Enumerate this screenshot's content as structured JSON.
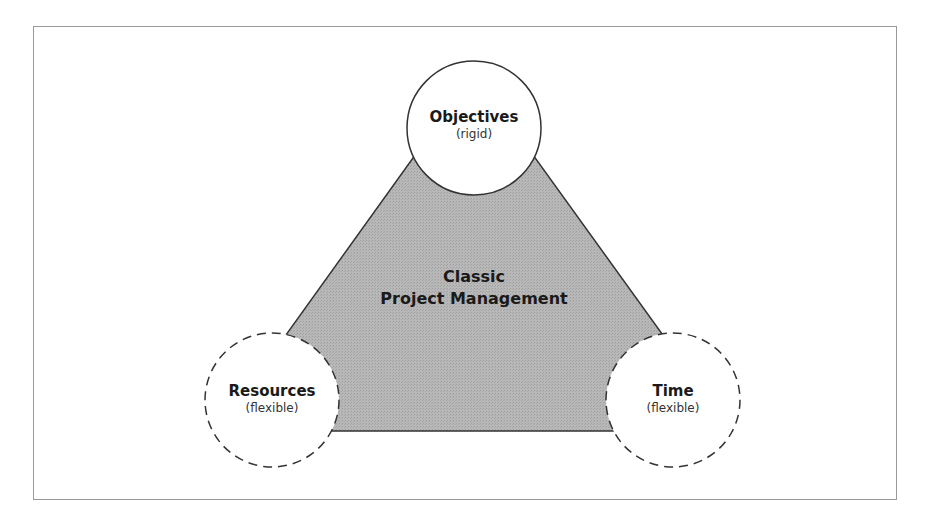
{
  "diagram": {
    "center": {
      "line1": "Classic",
      "line2": "Project Management"
    },
    "nodes": [
      {
        "title": "Objectives",
        "qualifier": "(rigid)",
        "border": "solid"
      },
      {
        "title": "Resources",
        "qualifier": "(flexible)",
        "border": "dashed"
      },
      {
        "title": "Time",
        "qualifier": "(flexible)",
        "border": "dashed"
      }
    ],
    "colors": {
      "triangle_fill": "#b3b3b3",
      "stroke": "#333333",
      "circle_fill": "#ffffff",
      "frame": "#9a9a9a"
    }
  }
}
